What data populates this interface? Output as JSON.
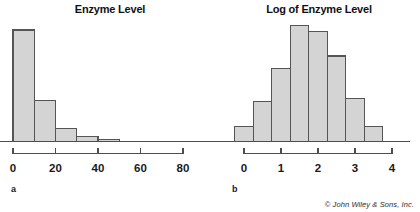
{
  "figure": {
    "credit": "© John Wiley & Sons, Inc.",
    "bar_fill": "#d4d4d4",
    "bar_stroke": "#555555",
    "axis_color": "#4d4d4d",
    "background": "#ffffff"
  },
  "panels": [
    {
      "id": "a",
      "label": "a",
      "title": "Enzyme Level"
    },
    {
      "id": "b",
      "label": "b",
      "title": "Log of Enzyme Level"
    }
  ],
  "chart_data": [
    {
      "type": "bar",
      "title": "Enzyme Level",
      "panel": "a",
      "xlabel": "",
      "ylabel": "",
      "grid": false,
      "legend": false,
      "xlim": [
        -3,
        90
      ],
      "ylim": [
        0,
        115
      ],
      "bin_width": 10,
      "x_tick_labels": [
        "0",
        "20",
        "40",
        "60",
        "80"
      ],
      "x_ticks": [
        0,
        20,
        40,
        60,
        80
      ],
      "bin_edges": [
        0,
        10,
        20,
        30,
        40,
        50
      ],
      "categories": [
        "0-10",
        "10-20",
        "20-30",
        "30-40",
        "40-50"
      ],
      "values": [
        111,
        41,
        13,
        5,
        2
      ],
      "note": "Right-skewed distribution of raw enzyme level"
    },
    {
      "type": "bar",
      "title": "Log of Enzyme Level",
      "panel": "b",
      "xlabel": "",
      "ylabel": "",
      "grid": false,
      "legend": false,
      "xlim": [
        -0.6,
        4.3
      ],
      "ylim": [
        0,
        42
      ],
      "bin_width": 0.5,
      "x_tick_labels": [
        "0",
        "1",
        "2",
        "3",
        "4"
      ],
      "x_ticks": [
        0,
        1,
        2,
        3,
        4
      ],
      "bin_edges": [
        -0.25,
        0.25,
        0.75,
        1.25,
        1.75,
        2.25,
        2.75,
        3.25,
        3.75
      ],
      "categories": [
        "-0.25-0.25",
        "0.25-0.75",
        "0.75-1.25",
        "1.25-1.75",
        "1.75-2.25",
        "2.25-2.75",
        "2.75-3.25",
        "3.25-3.75"
      ],
      "values": [
        5,
        13,
        24,
        38,
        36,
        28,
        14,
        5
      ],
      "note": "Approximately symmetric bell-shaped distribution after log transform"
    }
  ]
}
